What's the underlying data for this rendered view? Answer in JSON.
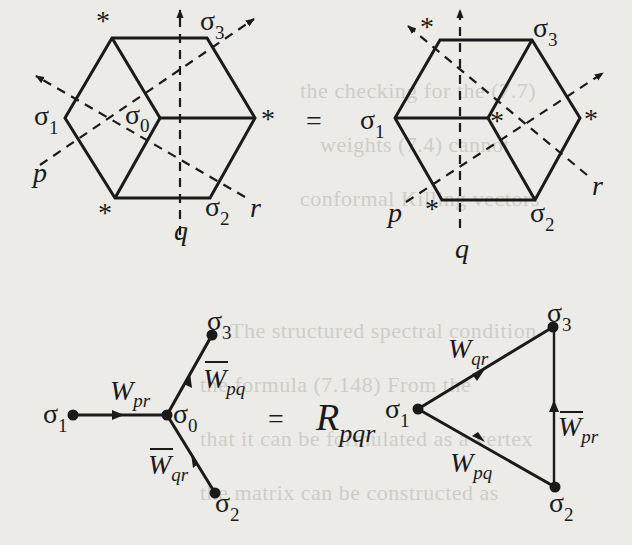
{
  "figure": {
    "top_row": {
      "equals": "=",
      "left_hexagon": {
        "vertex_labels": {
          "s1": "σ",
          "s1_sub": "1",
          "s0": "σ",
          "s0_sub": "0",
          "s2": "σ",
          "s2_sub": "2",
          "s3": "σ",
          "s3_sub": "3"
        },
        "star_marks": [
          "*",
          "*",
          "*"
        ],
        "axes": {
          "p": "p",
          "q": "q",
          "r": "r"
        }
      },
      "right_hexagon": {
        "vertex_labels": {
          "s1": "σ",
          "s1_sub": "1",
          "s2": "σ",
          "s2_sub": "2",
          "s3": "σ",
          "s3_sub": "3"
        },
        "star_marks": [
          "*",
          "*",
          "*"
        ],
        "axes": {
          "p": "p",
          "q": "q",
          "r": "r"
        }
      }
    },
    "bottom_row": {
      "equals": "=",
      "operator": {
        "main": "R",
        "sub": "pqr"
      },
      "star_graph": {
        "nodes": {
          "s1": "σ",
          "s1_sub": "1",
          "s0": "σ",
          "s0_sub": "0",
          "s2": "σ",
          "s2_sub": "2",
          "s3": "σ",
          "s3_sub": "3"
        },
        "edges": [
          {
            "from": "σ1",
            "to": "σ0",
            "label": "W",
            "sub": "pr",
            "bar": false
          },
          {
            "from": "σ0",
            "to": "σ3",
            "label": "W",
            "sub": "pq",
            "bar": true
          },
          {
            "from": "σ2",
            "to": "σ0",
            "label": "W",
            "sub": "qr",
            "bar": true
          }
        ]
      },
      "triangle_graph": {
        "nodes": {
          "s1": "σ",
          "s1_sub": "1",
          "s2": "σ",
          "s2_sub": "2",
          "s3": "σ",
          "s3_sub": "3"
        },
        "edges": [
          {
            "from": "σ1",
            "to": "σ3",
            "label": "W",
            "sub": "qr",
            "bar": false
          },
          {
            "from": "σ1",
            "to": "σ2",
            "label": "W",
            "sub": "pq",
            "bar": false
          },
          {
            "from": "σ2",
            "to": "σ3",
            "label": "W",
            "sub": "pr",
            "bar": true
          }
        ]
      }
    },
    "colors": {
      "ink": "#1a1a1a",
      "paper": "#ecebe7",
      "ghost_text": "#cfcdc8"
    }
  }
}
